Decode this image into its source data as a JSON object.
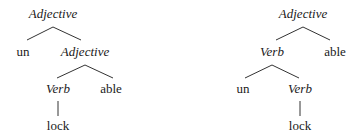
{
  "diagram": {
    "type": "morphological-tree-comparison",
    "trees": [
      {
        "name": "left-tree",
        "root": {
          "label": "Adjective",
          "italic": true,
          "children": [
            {
              "label": "un",
              "italic": false
            },
            {
              "label": "Adjective",
              "italic": true,
              "children": [
                {
                  "label": "Verb",
                  "italic": true,
                  "children": [
                    {
                      "label": "lock",
                      "italic": false
                    }
                  ]
                },
                {
                  "label": "able",
                  "italic": false
                }
              ]
            }
          ]
        }
      },
      {
        "name": "right-tree",
        "root": {
          "label": "Adjective",
          "italic": true,
          "children": [
            {
              "label": "Verb",
              "italic": true,
              "children": [
                {
                  "label": "un",
                  "italic": false
                },
                {
                  "label": "Verb",
                  "italic": true,
                  "children": [
                    {
                      "label": "lock",
                      "italic": false
                    }
                  ]
                }
              ]
            },
            {
              "label": "able",
              "italic": false
            }
          ]
        }
      }
    ]
  },
  "labels": {
    "left": {
      "root": "Adjective",
      "un": "un",
      "adj2": "Adjective",
      "verb": "Verb",
      "able": "able",
      "lock": "lock"
    },
    "right": {
      "root": "Adjective",
      "verb1": "Verb",
      "able": "able",
      "un": "un",
      "verb2": "Verb",
      "lock": "lock"
    }
  },
  "colors": {
    "text": "#1a1a1a",
    "lines": "#333333",
    "background": "#ffffff"
  }
}
